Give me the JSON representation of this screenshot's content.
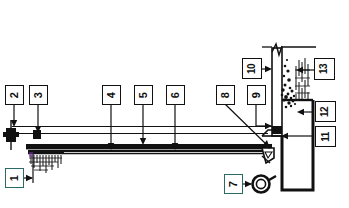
{
  "figure": {
    "orientation": "rotated-90",
    "callout_count": 13,
    "line_color": "#111111",
    "accent_color": "#2b6b66",
    "background_color": "#ffffff"
  },
  "callouts": [
    {
      "id": "callout-1",
      "label": "1"
    },
    {
      "id": "callout-2",
      "label": "2"
    },
    {
      "id": "callout-3",
      "label": "3"
    },
    {
      "id": "callout-4",
      "label": "4"
    },
    {
      "id": "callout-5",
      "label": "5"
    },
    {
      "id": "callout-6",
      "label": "6"
    },
    {
      "id": "callout-7",
      "label": "7"
    },
    {
      "id": "callout-8",
      "label": "8"
    },
    {
      "id": "callout-9",
      "label": "9"
    },
    {
      "id": "callout-10",
      "label": "10"
    },
    {
      "id": "callout-11",
      "label": "11"
    },
    {
      "id": "callout-12",
      "label": "12"
    },
    {
      "id": "callout-13",
      "label": "13"
    }
  ],
  "components": {
    "long_beam": "horizontal-beam",
    "upper_rail": "upper-rail-line",
    "left_end_block": "left-end-block",
    "ground_hatch": "hatched-foundation",
    "right_column": "vertical-column",
    "break_symbol": "zigzag-break-line",
    "stipple_material": "stippled-material-fill",
    "hatch_material": "hatched-material-fill",
    "roller": "roller-circle",
    "discharge_wedge": "discharge-wedge"
  }
}
